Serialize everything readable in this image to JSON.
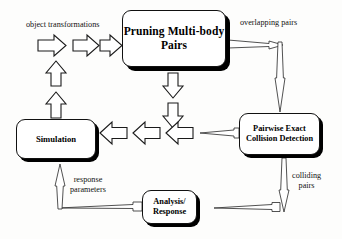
{
  "diagram": {
    "background_color": "#fdfdfc",
    "stroke_color": "#1a1a1a",
    "box_fill_color": "#ffffff",
    "shadow_color": "#000000",
    "nodes": [
      {
        "id": "pruning",
        "label": "Pruning\nMulti-body Pairs"
      },
      {
        "id": "pairwise",
        "label": "Pairwise Exact\nCollision Detection"
      },
      {
        "id": "simulation",
        "label": "Simulation"
      },
      {
        "id": "analysis",
        "label": "Analysis/\nResponse"
      }
    ],
    "edge_labels": [
      {
        "id": "object-transformations",
        "text": "object transformations"
      },
      {
        "id": "overlapping-pairs",
        "text": "overlapping pairs"
      },
      {
        "id": "colliding-pairs",
        "text": "colliding\npairs"
      },
      {
        "id": "response-parameters",
        "text": "response\nparameters"
      }
    ],
    "arrows": [
      {
        "id": "arrow-transform-1",
        "kind": "block",
        "direction": "right"
      },
      {
        "id": "arrow-transform-2",
        "kind": "block",
        "direction": "right"
      },
      {
        "id": "arrow-transform-3",
        "kind": "block",
        "direction": "right"
      },
      {
        "id": "arrow-sim-up-1",
        "kind": "block",
        "direction": "up"
      },
      {
        "id": "arrow-sim-up-2",
        "kind": "block",
        "direction": "up"
      },
      {
        "id": "arrow-prune-down-1",
        "kind": "block",
        "direction": "down"
      },
      {
        "id": "arrow-prune-down-2",
        "kind": "block",
        "direction": "down"
      },
      {
        "id": "arrow-left-1",
        "kind": "block",
        "direction": "left"
      },
      {
        "id": "arrow-left-2",
        "kind": "block",
        "direction": "left"
      },
      {
        "id": "arrow-left-3",
        "kind": "block",
        "direction": "left"
      },
      {
        "id": "arrow-overlapping-horizontal",
        "kind": "thin",
        "direction": "right"
      },
      {
        "id": "arrow-overlapping-vertical",
        "kind": "thin",
        "direction": "down"
      },
      {
        "id": "arrow-pairwise-to-left",
        "kind": "thin",
        "direction": "left"
      },
      {
        "id": "arrow-colliding-vertical",
        "kind": "thin",
        "direction": "down"
      },
      {
        "id": "arrow-colliding-horizontal",
        "kind": "thin",
        "direction": "left"
      },
      {
        "id": "arrow-response-horizontal",
        "kind": "thin",
        "direction": "left"
      },
      {
        "id": "arrow-response-vertical",
        "kind": "thin",
        "direction": "up"
      }
    ]
  }
}
